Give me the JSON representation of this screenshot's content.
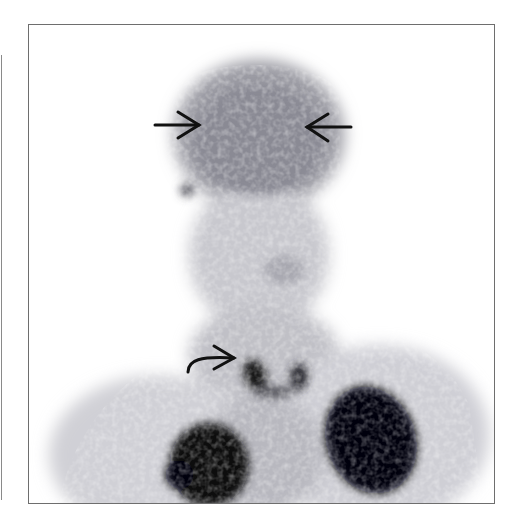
{
  "figure": {
    "type": "nuclear-medicine-scintigraphy",
    "view": "anterior head and neck",
    "colors": {
      "frame": "#6e6e6e",
      "background": "#ffffff",
      "uptake_max": "#0a0a0a",
      "uptake_mid": "#8c8c96"
    }
  },
  "annotations": [
    {
      "name": "straight-arrow-left",
      "direction": "right",
      "tail": [
        155,
        125
      ],
      "tip": [
        200,
        125
      ]
    },
    {
      "name": "straight-arrow-right",
      "direction": "left",
      "tail": [
        351,
        127
      ],
      "tip": [
        306,
        127
      ]
    },
    {
      "name": "curved-arrow",
      "direction": "right",
      "tail": [
        188,
        372
      ],
      "tip": [
        235,
        357
      ]
    }
  ]
}
